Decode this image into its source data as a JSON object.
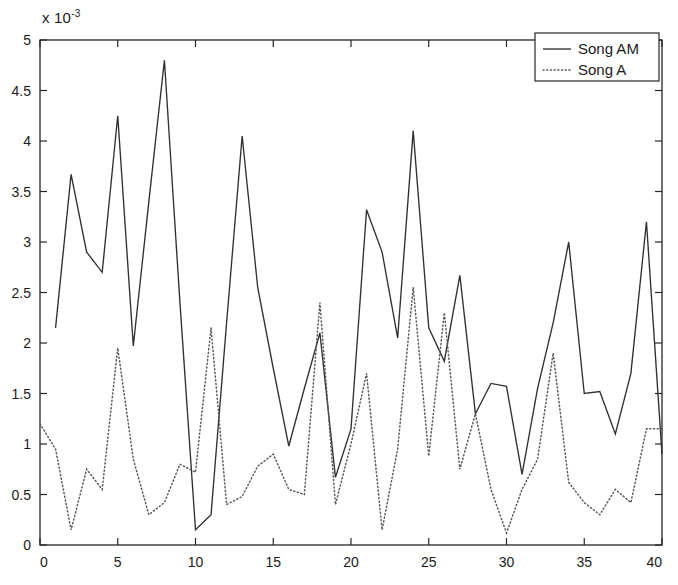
{
  "figure": {
    "exponent_prefix": "x 10",
    "exponent_power": "-3"
  },
  "legend": {
    "position": "top-right",
    "entries": [
      {
        "label": "Song AM",
        "style": "solid"
      },
      {
        "label": "Song A",
        "style": "dotted"
      }
    ]
  },
  "axes": {
    "x_ticks": [
      "0",
      "5",
      "10",
      "15",
      "20",
      "25",
      "30",
      "35",
      "40"
    ],
    "y_ticks": [
      "0",
      "0.5",
      "1",
      "1.5",
      "2",
      "2.5",
      "3",
      "3.5",
      "4",
      "4.5",
      "5"
    ]
  },
  "colors": {
    "background": "#ffffff",
    "axis": "#262626",
    "song_am": "#303030",
    "song_a": "#5a5a5a"
  },
  "chart_data": {
    "type": "line",
    "title": "",
    "xlabel": "",
    "ylabel": "",
    "y_multiplier": 0.001,
    "y_multiplier_text": "x 10^-3",
    "xlim": [
      0,
      40
    ],
    "ylim": [
      0,
      5
    ],
    "xticks": [
      0,
      5,
      10,
      15,
      20,
      25,
      30,
      35,
      40
    ],
    "yticks": [
      0,
      0.5,
      1,
      1.5,
      2,
      2.5,
      3,
      3.5,
      4,
      4.5,
      5
    ],
    "grid": false,
    "legend_position": "upper right",
    "x": [
      1,
      2,
      3,
      4,
      5,
      6,
      7,
      8,
      9,
      10,
      11,
      12,
      13,
      14,
      15,
      16,
      17,
      18,
      19,
      20,
      21,
      22,
      23,
      24,
      25,
      26,
      27,
      28,
      29,
      30,
      31,
      32,
      33,
      34,
      35,
      36,
      37,
      38,
      39,
      40
    ],
    "series": [
      {
        "name": "Song AM",
        "style": "solid",
        "x": [
          1,
          2,
          3,
          4,
          5,
          6,
          7,
          8,
          9,
          10,
          11,
          12,
          13,
          14,
          15,
          16,
          17,
          18,
          19,
          20,
          21,
          22,
          23,
          24,
          25,
          26,
          27,
          28,
          29,
          30,
          31,
          32,
          33,
          34,
          35,
          36,
          37,
          38,
          39,
          40
        ],
        "values": [
          2.15,
          3.67,
          2.9,
          2.7,
          4.25,
          1.97,
          3.4,
          4.8,
          2.4,
          0.15,
          0.3,
          2.2,
          4.05,
          2.55,
          1.75,
          0.98,
          1.55,
          2.1,
          0.67,
          1.15,
          3.32,
          2.9,
          2.05,
          4.1,
          2.15,
          1.82,
          2.67,
          1.3,
          1.6,
          1.57,
          0.7,
          1.55,
          2.2,
          3.0,
          1.5,
          1.52,
          1.1,
          1.7,
          3.2,
          0.9
        ]
      },
      {
        "name": "Song A",
        "style": "dotted",
        "x": [
          0,
          1,
          2,
          3,
          4,
          5,
          6,
          7,
          8,
          9,
          10,
          11,
          12,
          13,
          14,
          15,
          16,
          17,
          18,
          19,
          20,
          21,
          22,
          23,
          24,
          25,
          26,
          27,
          28,
          29,
          30,
          31,
          32,
          33,
          34,
          35,
          36,
          37,
          38,
          39,
          40
        ],
        "values": [
          1.2,
          0.95,
          0.15,
          0.75,
          0.55,
          1.95,
          0.85,
          0.3,
          0.42,
          0.8,
          0.72,
          2.15,
          0.4,
          0.48,
          0.78,
          0.9,
          0.55,
          0.5,
          2.4,
          0.4,
          1.0,
          1.7,
          0.15,
          0.95,
          2.55,
          0.88,
          2.3,
          0.75,
          1.3,
          0.55,
          0.12,
          0.55,
          0.85,
          1.9,
          0.62,
          0.42,
          0.3,
          0.55,
          0.42,
          1.15,
          1.15
        ]
      }
    ]
  }
}
